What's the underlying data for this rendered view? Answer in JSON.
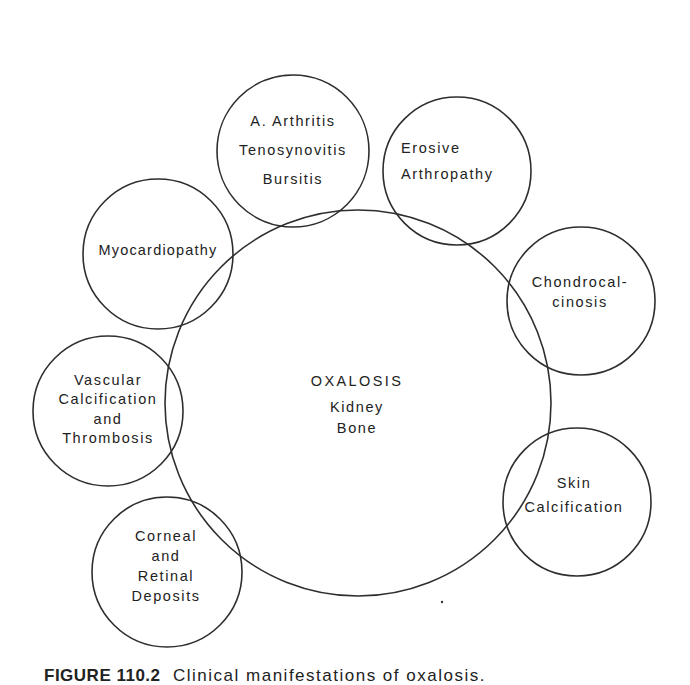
{
  "diagram": {
    "center": {
      "title": "OXALOSIS",
      "lines": [
        "Kidney",
        "Bone"
      ]
    },
    "satellites": [
      {
        "id": "arthritis",
        "lines": [
          "A. Arthritis",
          "Tenosynovitis",
          "Bursitis"
        ]
      },
      {
        "id": "erosive",
        "lines": [
          "Erosive",
          "Arthropathy"
        ]
      },
      {
        "id": "chondrocalcinosis",
        "lines": [
          "Chondrocal-",
          "cinosis"
        ]
      },
      {
        "id": "skin",
        "lines": [
          "Skin",
          "Calcification"
        ]
      },
      {
        "id": "corneal",
        "lines": [
          "Corneal",
          "and",
          "Retinal",
          "Deposits"
        ]
      },
      {
        "id": "vascular",
        "lines": [
          "Vascular",
          "Calcification",
          "and",
          "Thrombosis"
        ]
      },
      {
        "id": "myocardiopathy",
        "lines": [
          "Myocardiopathy"
        ]
      }
    ],
    "line_color": "#2e2e2e",
    "text_color": "#222222"
  },
  "caption": {
    "label": "FIGURE 110.2",
    "text": "Clinical manifestations of oxalosis."
  }
}
